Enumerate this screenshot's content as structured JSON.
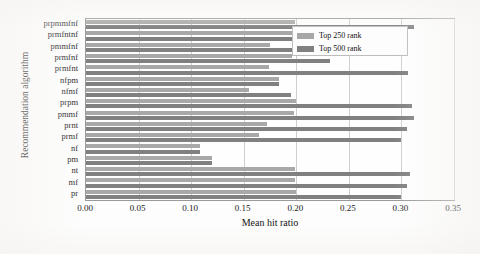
{
  "chart_data": {
    "type": "bar",
    "orientation": "horizontal",
    "title": "",
    "xlabel": "Mean hit ratio",
    "ylabel": "Recommendation algorithm",
    "xlim": [
      0.0,
      0.35
    ],
    "xticks": [
      "0.00",
      "0.05",
      "0.10",
      "0.15",
      "0.20",
      "0.25",
      "0.30",
      "0.35"
    ],
    "xtick_values": [
      0.0,
      0.05,
      0.1,
      0.15,
      0.2,
      0.25,
      0.3,
      0.35
    ],
    "grid": "vertical",
    "legend_position": "upper right",
    "categories": [
      "prpmmfnf",
      "prmfntnf",
      "pmmfnf",
      "prmfnf",
      "prmfnt",
      "nfpm",
      "nfmf",
      "prpm",
      "pmmf",
      "prnt",
      "prmf",
      "nf",
      "pm",
      "nt",
      "mf",
      "pr"
    ],
    "series": [
      {
        "name": "Top 250 rank",
        "color": "#a8a8a8",
        "values": [
          0.199,
          0.228,
          0.175,
          0.196,
          0.174,
          0.184,
          0.155,
          0.2,
          0.198,
          0.172,
          0.165,
          0.108,
          0.12,
          0.199,
          0.199,
          0.2
        ]
      },
      {
        "name": "Top 500 rank",
        "color": "#808080",
        "values": [
          0.312,
          0.234,
          0.305,
          0.232,
          0.306,
          0.184,
          0.195,
          0.31,
          0.312,
          0.305,
          0.3,
          0.108,
          0.12,
          0.308,
          0.305,
          0.3
        ]
      }
    ]
  },
  "legend": {
    "entries": [
      {
        "label": "Top 250 rank",
        "key": "top250"
      },
      {
        "label": "Top 500 rank",
        "key": "top500"
      }
    ]
  }
}
